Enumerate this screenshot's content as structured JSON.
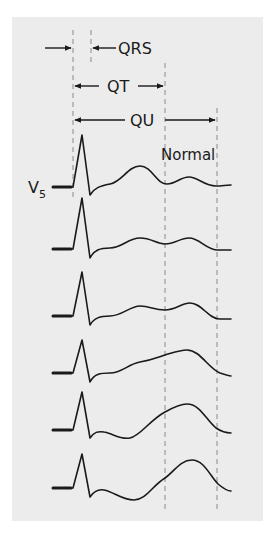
{
  "figure": {
    "labels": {
      "qrs": "QRS",
      "qt": "QT",
      "qu": "QU",
      "normal": "Normal",
      "lead": "V",
      "lead_subscript": "5"
    },
    "colors": {
      "panel": "#ececec",
      "trace": "#1a1a1a",
      "dashed_line": "#8a8a8a"
    },
    "intervals": [
      {
        "name": "QRS",
        "description": "Q onset to end of QRS"
      },
      {
        "name": "QT",
        "description": "Q onset to end of T wave"
      },
      {
        "name": "QU",
        "description": "Q onset to end of U wave"
      }
    ],
    "traces": [
      {
        "index": 1,
        "label": "Normal",
        "description": "Distinct T and U waves"
      },
      {
        "index": 2,
        "description": "Flattened T, U of similar height"
      },
      {
        "index": 3,
        "description": "T and U beginning to merge"
      },
      {
        "index": 4,
        "description": "T–U fusion, prominent U"
      },
      {
        "index": 5,
        "description": "Prominent U wave, T depressed"
      },
      {
        "index": 6,
        "description": "Giant U wave, ST depression"
      }
    ]
  }
}
